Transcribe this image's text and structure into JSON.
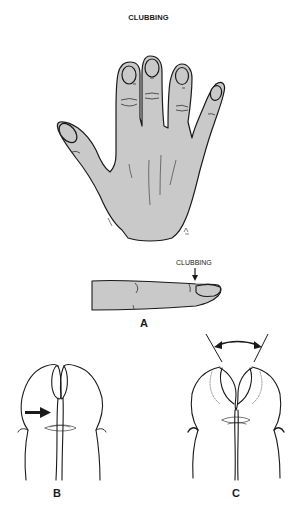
{
  "figure": {
    "title": "CLUBBING",
    "callout_label": "CLUBBING",
    "panels": [
      {
        "id": "A",
        "label": "A",
        "description": "Dorsal view of hand with clubbed fingertips and lateral view of clubbed finger"
      },
      {
        "id": "B",
        "label": "B",
        "description": "Normal fingers placed nail-to-nail showing diamond-shaped window"
      },
      {
        "id": "C",
        "label": "C",
        "description": "Clubbed fingers placed nail-to-nail with obliterated window and wide distal angle"
      }
    ],
    "colors": {
      "skin_fill": "#c9c9c9",
      "outline": "#1a1a1a",
      "background": "#ffffff"
    }
  }
}
